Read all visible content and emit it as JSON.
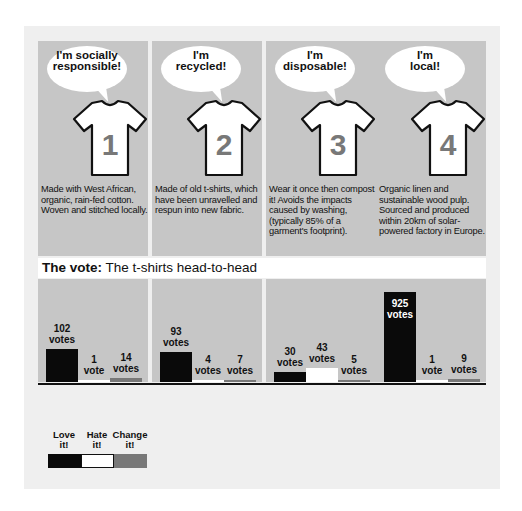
{
  "colors": {
    "love": "#0a0a0a",
    "hate": "#ffffff",
    "change": "#787878",
    "panel": "#c6c6c6",
    "background": "#efefef"
  },
  "shirts": [
    {
      "number": "1",
      "bubble": [
        "I'm socially",
        "responsible!"
      ],
      "description": "Made with West African, organic, rain-fed cotton. Woven and stitched locally."
    },
    {
      "number": "2",
      "bubble": [
        "I'm",
        "recycled!"
      ],
      "description": "Made of old t-shirts, which have been unravelled and respun into new fabric."
    },
    {
      "number": "3",
      "bubble": [
        "I'm",
        "disposable!"
      ],
      "description": "Wear it once then compost it! Avoids the impacts caused by washing, (typically 85% of a garment's footprint)."
    },
    {
      "number": "4",
      "bubble": [
        "I'm",
        "local!"
      ],
      "description": "Organic linen and sustainable wood pulp. Sourced and produced within 20km of solar-powered factory in Europe."
    }
  ],
  "vote_title": {
    "bold": "The vote:",
    "rest": " The t-shirts head-to-head"
  },
  "legend": [
    {
      "label": [
        "Love",
        "it!"
      ],
      "key": "love"
    },
    {
      "label": [
        "Hate",
        "it!"
      ],
      "key": "hate"
    },
    {
      "label": [
        "Change",
        "it!"
      ],
      "key": "change"
    }
  ],
  "chart_data": {
    "type": "bar",
    "title": "The vote: The t-shirts head-to-head",
    "categories": [
      "T-shirt 1 (socially responsible)",
      "T-shirt 2 (recycled)",
      "T-shirt 3 (disposable)",
      "T-shirt 4 (local)"
    ],
    "series": [
      {
        "name": "Love it!",
        "values": [
          102,
          93,
          30,
          925
        ]
      },
      {
        "name": "Hate it!",
        "values": [
          1,
          4,
          43,
          1
        ]
      },
      {
        "name": "Change it!",
        "values": [
          14,
          7,
          5,
          9
        ]
      }
    ],
    "value_labels": [
      [
        "102 votes",
        "1 vote",
        "14 votes"
      ],
      [
        "93 votes",
        "4 votes",
        "7 votes"
      ],
      [
        "30 votes",
        "43 votes",
        "5 votes"
      ],
      [
        "925 votes",
        "1 vote",
        "9 votes"
      ]
    ],
    "xlabel": "",
    "ylabel": "",
    "grid": false,
    "legend_position": "bottom-left"
  }
}
